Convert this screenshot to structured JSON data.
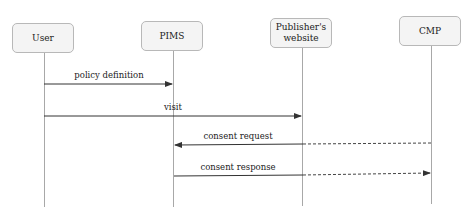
{
  "diagram": {
    "type": "sequence",
    "participants": [
      {
        "id": "user",
        "label": "User",
        "x": 44
      },
      {
        "id": "pims",
        "label": "PIMS",
        "x": 173
      },
      {
        "id": "publisher",
        "label": "Publisher's website",
        "label_lines": [
          "Publisher's",
          "website"
        ],
        "x": 302
      },
      {
        "id": "cmp",
        "label": "CMP",
        "x": 431
      }
    ],
    "messages": [
      {
        "label": "policy definition",
        "from": "user",
        "to": "pims",
        "style": "solid",
        "y": 84
      },
      {
        "label": "visit",
        "from": "user",
        "to": "publisher",
        "style": "solid",
        "y": 116
      },
      {
        "label": "consent request",
        "from": "cmp",
        "to": "pims",
        "style": "mixed-dashed",
        "y": 145
      },
      {
        "label": "consent response",
        "from": "pims",
        "to": "cmp",
        "style": "mixed-dashed",
        "y": 175
      }
    ],
    "colors": {
      "box_fill": "#f4f4f4",
      "box_border": "#b8b8b8",
      "lifeline": "#a8a8a8",
      "arrow": "#333333"
    }
  }
}
